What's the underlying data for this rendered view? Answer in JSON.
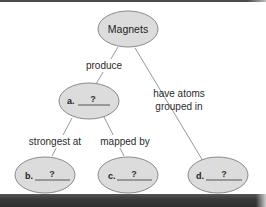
{
  "diagram": {
    "type": "concept-map",
    "root": {
      "id": "magnets",
      "label": "Magnets"
    },
    "nodes": [
      {
        "id": "a",
        "letter": "a.",
        "answer": "?"
      },
      {
        "id": "b",
        "letter": "b.",
        "answer": "?"
      },
      {
        "id": "c",
        "letter": "c.",
        "answer": "?"
      },
      {
        "id": "d",
        "letter": "d.",
        "answer": "?"
      }
    ],
    "links": [
      {
        "from": "magnets",
        "to": "a",
        "label": "produce"
      },
      {
        "from": "a",
        "to": "b",
        "label": "strongest at"
      },
      {
        "from": "a",
        "to": "c",
        "label": "mapped by"
      },
      {
        "from": "magnets",
        "to": "d",
        "label_line1": "have atoms",
        "label_line2": "grouped in"
      }
    ],
    "colors": {
      "node_fill": "#dcdcdc",
      "node_stroke": "#8a8a8a",
      "link": "#8c8c8c",
      "bar": "#3a3a3a"
    }
  }
}
